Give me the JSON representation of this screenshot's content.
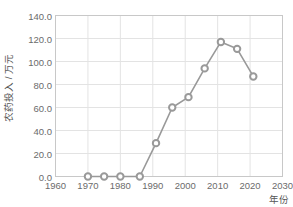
{
  "chart_data": {
    "type": "line",
    "title": "",
    "xlabel": "年份",
    "ylabel": "农药投入 / 万元",
    "xlim": [
      1960,
      2030
    ],
    "ylim": [
      0.0,
      140.0
    ],
    "xticks": [
      1960,
      1970,
      1980,
      1990,
      2000,
      2010,
      2020,
      2030
    ],
    "xtick_labels": [
      "1960",
      "1970",
      "1980",
      "1990",
      "2000",
      "2010",
      "2020",
      "2030"
    ],
    "yticks": [
      0.0,
      20.0,
      40.0,
      60.0,
      80.0,
      100.0,
      120.0,
      140.0
    ],
    "ytick_labels": [
      "0.0",
      "20.0",
      "40.0",
      "60.0",
      "80.0",
      "100.0",
      "120.0",
      "140.0"
    ],
    "grid": true,
    "legend": false,
    "marker": "circle-open",
    "series": [
      {
        "name": "农药投入",
        "color": "#999999",
        "x": [
          1970,
          1975,
          1980,
          1986,
          1991,
          1996,
          2001,
          2006,
          2011,
          2016,
          2021
        ],
        "values": [
          0.0,
          0.0,
          0.0,
          0.0,
          29.0,
          60.0,
          69.0,
          94.0,
          117.0,
          111.0,
          87.0
        ]
      }
    ]
  },
  "style": {
    "line_color": "#999999",
    "marker_face": "#ffffff",
    "marker_edge": "#999999",
    "grid_color": "#e3e3e3",
    "axis_color": "#c8c8c8",
    "tick_text_color": "#6b6b6b",
    "label_text_color": "#555555",
    "background": "#ffffff"
  }
}
